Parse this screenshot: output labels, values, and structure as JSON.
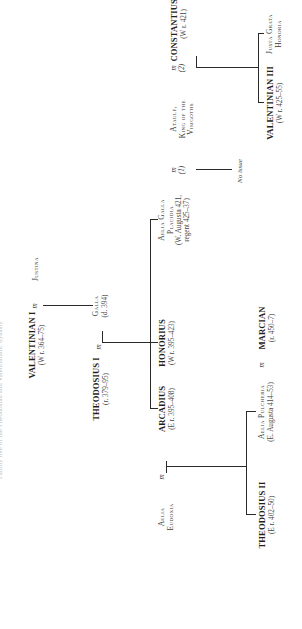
{
  "header": {
    "running_head": "Family tree of the Theodosian and Valentinianic dynasty"
  },
  "tree": {
    "valentinian_i": {
      "name": "VALENTINIAN I",
      "dates": "(W r. 364–75)"
    },
    "justina": {
      "name": "Justina"
    },
    "galla": {
      "name": "Galla",
      "dates": "(d. 394)"
    },
    "theodosius_i": {
      "name": "THEODOSIUS I",
      "dates": "(r. 379–95)"
    },
    "arcadius": {
      "name": "ARCADIUS",
      "dates": "(E r. 395–408)"
    },
    "aelia_eudoxia": {
      "name_line1": "Aelia",
      "name_line2": "Eudoxia"
    },
    "honorius": {
      "name": "HONORIUS",
      "dates": "(W r. 395–423)"
    },
    "aelia_galla_placidia": {
      "name_line1": "Aelia Galla",
      "name_line2": "Placidia",
      "dates_line1": "(W. Augusta 421,",
      "dates_line2": "regent 425–37)"
    },
    "ataulf": {
      "name_line1": "Ataulf,",
      "name_line2": "King of the",
      "name_line3": "Visigoths"
    },
    "constantius_iii": {
      "name": "CONSTANTIUS III",
      "dates": "(W r. 421)"
    },
    "theodosius_ii": {
      "name": "THEODOSIUS II",
      "dates": "(E r. 402–50)"
    },
    "aelia_pulcheria": {
      "name": "Aelia Pulcheria",
      "dates": "(E. Augusta 414–53)"
    },
    "marcian": {
      "name": "MARCIAN",
      "dates": "(r. 450–7)"
    },
    "valentinian_iii": {
      "name": "VALENTINIAN III",
      "dates": "(W r. 425–55)"
    },
    "justa_grata_honoria": {
      "name_line1": "Justa Grata",
      "name_line2": "Honoria"
    },
    "no_issue": "No issue"
  },
  "marks": {
    "married": "m",
    "first_marriage": "(1)",
    "second_marriage": "(2)"
  },
  "colors": {
    "line": "#2b2b2b",
    "text": "#2a2a2a",
    "background": "#ffffff"
  }
}
